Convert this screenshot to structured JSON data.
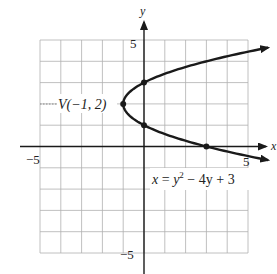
{
  "chart_data": {
    "type": "line",
    "title": "",
    "xlabel": "x",
    "ylabel": "y",
    "xlim": [
      -5,
      5
    ],
    "ylim": [
      -5,
      5
    ],
    "grid": true,
    "tick_labels": {
      "x_min": "−5",
      "x_max": "5",
      "y_max": "5",
      "y_min": "−5"
    },
    "series": [
      {
        "name": "x = y^2 - 4y + 3",
        "equation_label": "x = y² − 4y + 3",
        "form": "x as function of y",
        "coefficients": {
          "a": 1,
          "b": -4,
          "c": 3
        },
        "y_range": [
          -0.64,
          4.64
        ]
      }
    ],
    "points": [
      {
        "x": -1,
        "y": 2,
        "label": "V(−1, 2)",
        "role": "vertex"
      },
      {
        "x": 0,
        "y": 3,
        "label": "",
        "role": "y-intercept"
      },
      {
        "x": 0,
        "y": 1,
        "label": "",
        "role": "y-intercept"
      },
      {
        "x": 3,
        "y": 0,
        "label": "",
        "role": "x-intercept"
      }
    ],
    "annotations": [
      {
        "text": "V(−1, 2)",
        "at": [
          -1,
          2
        ]
      },
      {
        "text": "x = y² − 4y + 3",
        "at": [
          3,
          -1.5
        ]
      }
    ]
  },
  "labels": {
    "x_axis": "x",
    "y_axis": "y",
    "x_min": "−5",
    "x_max": "5",
    "y_max": "5",
    "y_min": "−5",
    "vertex": "V(−1, 2)",
    "eq_x": "x",
    "eq_mid": " = ",
    "eq_y": "y",
    "eq_exp": "2",
    "eq_rest": " − 4y + 3"
  },
  "colors": {
    "curve": "#1a1a1a",
    "grid": "#b0b0b0",
    "axis": "#1a1a1a"
  }
}
